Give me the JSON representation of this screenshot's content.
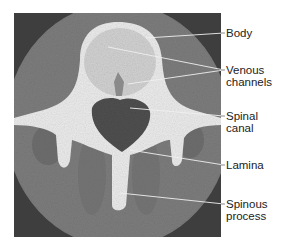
{
  "figure": {
    "labels": [
      {
        "id": "body",
        "lines": [
          "Body"
        ]
      },
      {
        "id": "venous",
        "lines": [
          "Venous",
          "channels"
        ]
      },
      {
        "id": "spinal",
        "lines": [
          "Spinal",
          "canal"
        ]
      },
      {
        "id": "lamina",
        "lines": [
          "Lamina"
        ]
      },
      {
        "id": "spinous",
        "lines": [
          "Spinous",
          "process"
        ]
      }
    ],
    "colors": {
      "background": "#ffffff",
      "ct_field": "#7a7a7a",
      "bone": "#ececec",
      "canal": "#555555",
      "leader_line": "#e8e8e8",
      "text": "#222222"
    }
  }
}
